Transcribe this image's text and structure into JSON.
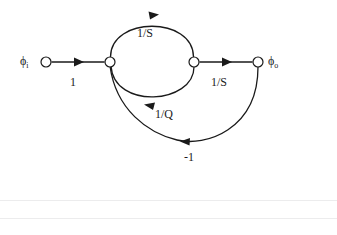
{
  "figure": {
    "type": "signal-flow-graph",
    "title": "",
    "background_color": "#ffffff",
    "stroke_color": "#1a1a1a",
    "nodes": [
      {
        "id": "phi_i",
        "label_base": "ϕ",
        "label_sub": "i",
        "x": 46,
        "y": 62,
        "r": 5,
        "label_x": 20,
        "label_y": 55
      },
      {
        "id": "n1",
        "label_base": "",
        "label_sub": "",
        "x": 110,
        "y": 62,
        "r": 5,
        "label_x": 0,
        "label_y": 0
      },
      {
        "id": "n2",
        "label_base": "",
        "label_sub": "",
        "x": 194,
        "y": 62,
        "r": 5,
        "label_x": 0,
        "label_y": 0
      },
      {
        "id": "phi_o",
        "label_base": "ϕ",
        "label_sub": "o",
        "x": 258,
        "y": 62,
        "r": 5,
        "label_x": 268,
        "label_y": 55
      }
    ],
    "edges": [
      {
        "id": "e-input",
        "from": "phi_i",
        "to": "n1",
        "gain": "1",
        "shape": "straight",
        "label_x": 70,
        "label_y": 76,
        "arrow_dir": "right"
      },
      {
        "id": "e-forward-top",
        "from": "n1",
        "to": "n2",
        "gain": "1/S",
        "shape": "arc-above",
        "label_x": 137,
        "label_y": 27,
        "arrow_dir": "right"
      },
      {
        "id": "e-feedback-q",
        "from": "n2",
        "to": "n1",
        "gain": "1/Q",
        "shape": "arc-below",
        "label_x": 155,
        "label_y": 108,
        "arrow_dir": "left"
      },
      {
        "id": "e-output",
        "from": "n2",
        "to": "phi_o",
        "gain": "1/S",
        "shape": "straight",
        "label_x": 211,
        "label_y": 76,
        "arrow_dir": "right"
      },
      {
        "id": "e-feedback-unity",
        "from": "phi_o",
        "to": "n1",
        "gain": "-1",
        "shape": "arc-below-wide",
        "label_x": 184,
        "label_y": 151,
        "arrow_dir": "left"
      }
    ]
  },
  "page_rules": [
    {
      "id": "rule-upper",
      "y": 200
    },
    {
      "id": "rule-lower",
      "y": 218
    }
  ]
}
